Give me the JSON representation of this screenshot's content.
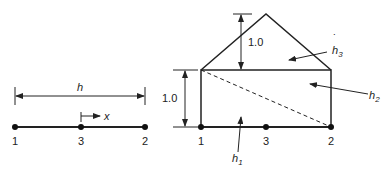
{
  "left_figure": {
    "dimension_label": "h",
    "coordinate_label": "x",
    "nodes": [
      {
        "id": "1",
        "label": "1"
      },
      {
        "id": "3",
        "label": "3"
      },
      {
        "id": "2",
        "label": "2"
      }
    ]
  },
  "right_figure": {
    "height_label_top": "1.0",
    "height_label_left": "1.0",
    "nodes": [
      {
        "id": "1",
        "label": "1"
      },
      {
        "id": "3",
        "label": "3"
      },
      {
        "id": "2",
        "label": "2"
      }
    ],
    "regions": [
      {
        "name": "h1",
        "base": "h",
        "sub": "1"
      },
      {
        "name": "h2",
        "base": "h",
        "sub": "2"
      },
      {
        "name": "h3",
        "base": "h",
        "sub": "3",
        "accent": "˙"
      }
    ]
  }
}
